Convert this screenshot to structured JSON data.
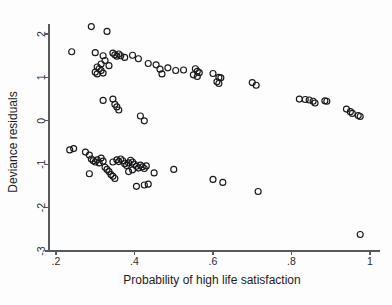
{
  "figure": {
    "background_color": "#fdfdfd",
    "marker_color": "#17181a",
    "axis_color": "#555a5e"
  },
  "chart_data": {
    "type": "scatter",
    "title": "",
    "xlabel": "Probability of high life satisfaction",
    "ylabel": "Deviance residuals",
    "xlim": [
      0.185,
      1.005
    ],
    "ylim": [
      -3.05,
      2.3
    ],
    "xticks": [
      0.2,
      0.4,
      0.6,
      0.8,
      1
    ],
    "xticklabels": [
      ".2",
      ".4",
      ".6",
      ".8",
      "1"
    ],
    "yticks": [
      2,
      1,
      0,
      -1,
      -2,
      -3
    ],
    "yticklabels": [
      "2",
      "1",
      "0",
      "-1",
      "-2",
      "-3"
    ],
    "grid": false,
    "legend": null,
    "marker": "open-circle",
    "marker_size": 6,
    "series": [
      {
        "name": "deviance residuals",
        "points": [
          [
            0.29,
            2.17
          ],
          [
            0.33,
            2.06
          ],
          [
            0.24,
            1.59
          ],
          [
            0.3,
            1.57
          ],
          [
            0.32,
            1.5
          ],
          [
            0.345,
            1.56
          ],
          [
            0.35,
            1.52
          ],
          [
            0.355,
            1.49
          ],
          [
            0.36,
            1.54
          ],
          [
            0.365,
            1.5
          ],
          [
            0.375,
            1.46
          ],
          [
            0.395,
            1.51
          ],
          [
            0.325,
            1.39
          ],
          [
            0.315,
            1.31
          ],
          [
            0.335,
            1.27
          ],
          [
            0.305,
            1.24
          ],
          [
            0.31,
            1.2
          ],
          [
            0.315,
            1.16
          ],
          [
            0.3,
            1.12
          ],
          [
            0.305,
            1.08
          ],
          [
            0.32,
            1.1
          ],
          [
            0.41,
            1.43
          ],
          [
            0.435,
            1.32
          ],
          [
            0.455,
            1.29
          ],
          [
            0.465,
            1.19
          ],
          [
            0.47,
            1.08
          ],
          [
            0.485,
            1.22
          ],
          [
            0.505,
            1.16
          ],
          [
            0.525,
            1.17
          ],
          [
            0.555,
            1.2
          ],
          [
            0.56,
            1.14
          ],
          [
            0.565,
            1.11
          ],
          [
            0.55,
            1.06
          ],
          [
            0.56,
            1.02
          ],
          [
            0.6,
            1.09
          ],
          [
            0.615,
            1.0
          ],
          [
            0.62,
            0.99
          ],
          [
            0.61,
            0.9
          ],
          [
            0.615,
            0.86
          ],
          [
            0.7,
            0.88
          ],
          [
            0.71,
            0.82
          ],
          [
            0.82,
            0.5
          ],
          [
            0.835,
            0.49
          ],
          [
            0.845,
            0.48
          ],
          [
            0.855,
            0.45
          ],
          [
            0.86,
            0.41
          ],
          [
            0.885,
            0.46
          ],
          [
            0.89,
            0.45
          ],
          [
            0.94,
            0.27
          ],
          [
            0.95,
            0.21
          ],
          [
            0.955,
            0.17
          ],
          [
            0.97,
            0.12
          ],
          [
            0.975,
            0.1
          ],
          [
            0.32,
            0.47
          ],
          [
            0.345,
            0.5
          ],
          [
            0.35,
            0.38
          ],
          [
            0.355,
            0.32
          ],
          [
            0.36,
            0.25
          ],
          [
            0.415,
            0.11
          ],
          [
            0.425,
            0.0
          ],
          [
            0.235,
            -0.67
          ],
          [
            0.245,
            -0.64
          ],
          [
            0.275,
            -0.72
          ],
          [
            0.285,
            -0.79
          ],
          [
            0.29,
            -0.88
          ],
          [
            0.295,
            -0.92
          ],
          [
            0.3,
            -0.95
          ],
          [
            0.305,
            -0.9
          ],
          [
            0.31,
            -0.97
          ],
          [
            0.315,
            -0.86
          ],
          [
            0.32,
            -0.93
          ],
          [
            0.325,
            -1.07
          ],
          [
            0.33,
            -1.12
          ],
          [
            0.335,
            -1.17
          ],
          [
            0.285,
            -1.22
          ],
          [
            0.34,
            -1.24
          ],
          [
            0.345,
            -1.28
          ],
          [
            0.35,
            -1.33
          ],
          [
            0.345,
            -0.95
          ],
          [
            0.355,
            -0.9
          ],
          [
            0.36,
            -0.94
          ],
          [
            0.365,
            -0.88
          ],
          [
            0.37,
            -0.92
          ],
          [
            0.375,
            -0.99
          ],
          [
            0.38,
            -1.03
          ],
          [
            0.385,
            -0.97
          ],
          [
            0.39,
            -0.91
          ],
          [
            0.395,
            -0.95
          ],
          [
            0.4,
            -1.0
          ],
          [
            0.405,
            -1.05
          ],
          [
            0.41,
            -1.09
          ],
          [
            0.395,
            -1.13
          ],
          [
            0.385,
            -1.17
          ],
          [
            0.415,
            -1.02
          ],
          [
            0.42,
            -1.06
          ],
          [
            0.425,
            -1.1
          ],
          [
            0.43,
            -1.04
          ],
          [
            0.405,
            -1.51
          ],
          [
            0.425,
            -1.48
          ],
          [
            0.435,
            -1.46
          ],
          [
            0.45,
            -1.2
          ],
          [
            0.5,
            -1.12
          ],
          [
            0.6,
            -1.35
          ],
          [
            0.625,
            -1.42
          ],
          [
            0.715,
            -1.63
          ],
          [
            0.975,
            -2.62
          ]
        ]
      }
    ]
  }
}
